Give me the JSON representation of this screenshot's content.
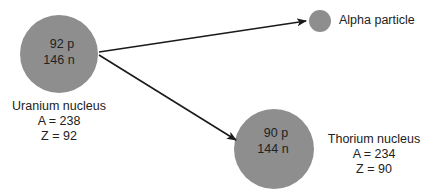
{
  "colors": {
    "nucleus_fill": "#8e8e8e",
    "arrow": "#1a1a1a",
    "background": "#ffffff"
  },
  "uranium": {
    "protons": "92 p",
    "neutrons": "146 n",
    "name": "Uranium nucleus",
    "mass_number": "A = 238",
    "atomic_number": "Z = 92"
  },
  "alpha": {
    "name": "Alpha particle"
  },
  "thorium": {
    "protons": "90 p",
    "neutrons": "144 n",
    "name": "Thorium nucleus",
    "mass_number": "A = 234",
    "atomic_number": "Z = 90"
  }
}
